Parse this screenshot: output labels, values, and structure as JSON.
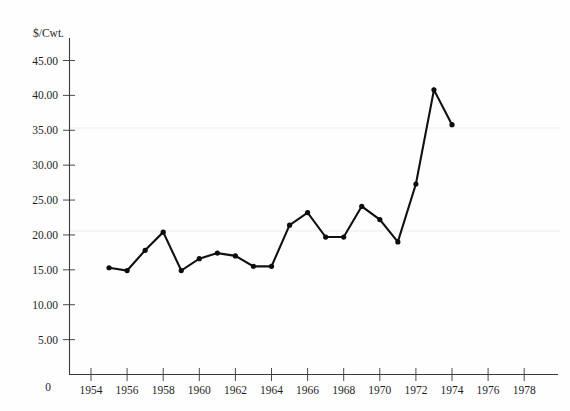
{
  "chart_data": {
    "type": "line",
    "title": "",
    "xlabel": "",
    "ylabel": "$/Cwt.",
    "x": [
      1955,
      1956,
      1957,
      1958,
      1959,
      1960,
      1961,
      1962,
      1963,
      1964,
      1965,
      1966,
      1967,
      1968,
      1969,
      1970,
      1971,
      1972,
      1973,
      1974
    ],
    "values": [
      15.3,
      14.9,
      17.8,
      20.4,
      14.9,
      16.6,
      17.4,
      17.0,
      15.5,
      15.5,
      21.4,
      23.2,
      19.7,
      19.7,
      24.1,
      22.2,
      19.0,
      27.3,
      40.8,
      35.8
    ],
    "xlim": [
      1953,
      1979
    ],
    "ylim": [
      0,
      47
    ],
    "grid": false,
    "legend": null,
    "x_ticks": [
      "1954",
      "1956",
      "1958",
      "1960",
      "1962",
      "1964",
      "1966",
      "1968",
      "1970",
      "1972",
      "1974",
      "1976",
      "1978"
    ],
    "x_tick_values": [
      1954,
      1956,
      1958,
      1960,
      1962,
      1964,
      1966,
      1968,
      1970,
      1972,
      1974,
      1976,
      1978
    ],
    "y_ticks": [
      "5.00",
      "10.00",
      "15.00",
      "20.00",
      "25.00",
      "30.00",
      "35.00",
      "40.00",
      "45.00"
    ],
    "y_tick_values": [
      5,
      10,
      15,
      20,
      25,
      30,
      35,
      40,
      45
    ],
    "origin_label": "0",
    "marker": "filled-circle",
    "line_color": "#111111",
    "axis_color": "#3a3a3a"
  },
  "meta": {
    "y_axis_caption": "$/Cwt."
  }
}
